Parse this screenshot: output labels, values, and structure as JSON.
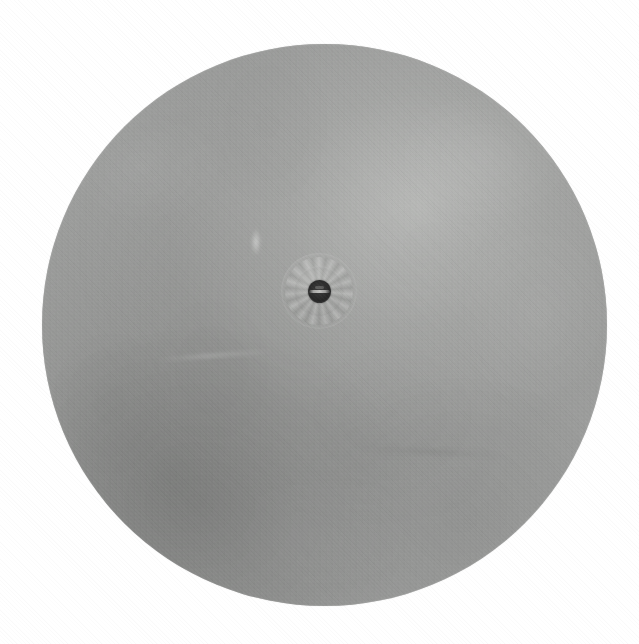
{
  "image": {
    "kind": "photograph",
    "subject": "circular metal disc",
    "background_color": "#ffffff",
    "width_px": 639,
    "height_px": 644,
    "alt_text": "Top-down photograph of a large flat circular grey metal disc on a plain white background, with a small crimped hub and a dark central hole slightly above and left of centre."
  },
  "object": {
    "name": "metal-disc",
    "shape": "circle",
    "center_x_px": 324,
    "center_y_px": 325,
    "radius_px": 282,
    "bounds": {
      "left_px": 42,
      "top_px": 44,
      "width_px": 565,
      "height_px": 562
    },
    "base_color": "#9a9b9a",
    "highlight_color": "#bebfbd",
    "shadow_color": "#787977",
    "surface_finish": "brushed / ground metal with cloudy mottling",
    "lighting": "diffuse, brighter toward upper-right, darker toward lower-left"
  },
  "hub": {
    "name": "centre-hub",
    "center_x_px": 319,
    "center_y_px": 291,
    "outer_radius_px": 38,
    "inner_radius_px": 25,
    "collar_style": "crimped ring",
    "hole": {
      "name": "centre-hole",
      "center_x_px": 319,
      "center_y_px": 291,
      "radius_px": 11,
      "color": "#2a2a2a",
      "highlight": "bright horizontal slit across the opening"
    }
  },
  "marks": [
    {
      "name": "light-streak",
      "x_px": 262,
      "y_px": 255,
      "description": "small pale vertical scratch above and left of hub"
    },
    {
      "name": "scuff-left",
      "x_px": 155,
      "y_px": 360,
      "description": "faint light scuff left of centre"
    },
    {
      "name": "scuff-lower-right",
      "x_px": 400,
      "y_px": 455,
      "description": "faint dark smudge lower right"
    }
  ]
}
